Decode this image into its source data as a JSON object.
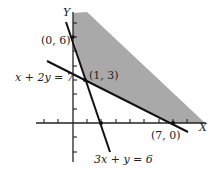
{
  "diagram": {
    "axes": {
      "x_label": "X",
      "y_label": "Y"
    },
    "points": [
      {
        "label": "(0, 6)"
      },
      {
        "label": "(1, 3)"
      },
      {
        "label": "(7, 0)"
      }
    ],
    "lines": [
      {
        "label": "x + 2y = 7"
      },
      {
        "label": "3x + y = 6"
      }
    ],
    "colors": {
      "region": "#a9a9a9",
      "line": "#111111",
      "axis": "#222222"
    }
  }
}
